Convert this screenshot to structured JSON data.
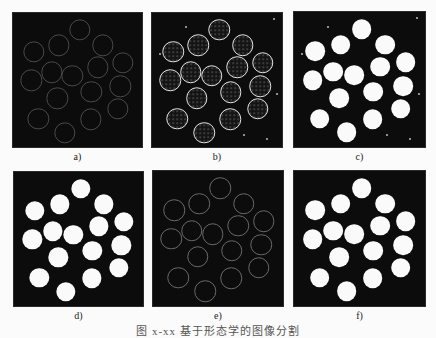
{
  "figure": {
    "caption": "图 x-xx 基于形态学的图像分割",
    "panels": [
      {
        "id": "a",
        "label": "a)",
        "style": "faint-ring",
        "x": 13,
        "y": 13,
        "w": 129,
        "h": 134
      },
      {
        "id": "b",
        "label": "b)",
        "style": "bright-ring",
        "x": 152,
        "y": 13,
        "w": 130,
        "h": 134
      },
      {
        "id": "c",
        "label": "c)",
        "style": "filled",
        "x": 294,
        "y": 12,
        "w": 131,
        "h": 135
      },
      {
        "id": "d",
        "label": "d)",
        "style": "filled",
        "x": 14,
        "y": 172,
        "w": 129,
        "h": 134
      },
      {
        "id": "e",
        "label": "e)",
        "style": "thin-ring",
        "x": 153,
        "y": 171,
        "w": 130,
        "h": 135
      },
      {
        "id": "f",
        "label": "f)",
        "style": "filled",
        "x": 294,
        "y": 171,
        "w": 131,
        "h": 135
      }
    ],
    "circle_diameter_ratio": 0.15,
    "circles": [
      [
        0.518,
        0.126
      ],
      [
        0.356,
        0.241
      ],
      [
        0.698,
        0.241
      ],
      [
        0.162,
        0.289
      ],
      [
        0.853,
        0.372
      ],
      [
        0.657,
        0.405
      ],
      [
        0.299,
        0.442
      ],
      [
        0.459,
        0.467
      ],
      [
        0.142,
        0.503
      ],
      [
        0.832,
        0.548
      ],
      [
        0.606,
        0.59
      ],
      [
        0.343,
        0.636
      ],
      [
        0.814,
        0.716
      ],
      [
        0.196,
        0.791
      ],
      [
        0.601,
        0.794
      ],
      [
        0.402,
        0.892
      ]
    ]
  }
}
